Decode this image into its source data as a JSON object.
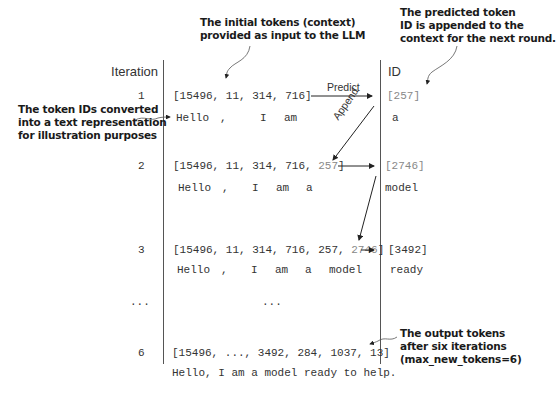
{
  "headers": {
    "iteration": "Iteration",
    "id": "ID"
  },
  "annotations": {
    "initial_tokens": [
      "The initial tokens (context)",
      "provided as input to the LLM"
    ],
    "predicted_token": [
      "The predicted token",
      "ID is appended to the",
      "context for the next round."
    ],
    "token_ids_text": [
      "The token IDs converted",
      "into a text representation",
      "for illustration purposes"
    ],
    "output_tokens": [
      "The output tokens",
      "after six iterations",
      "(max_new_tokens=6)"
    ]
  },
  "arrow_labels": {
    "predict": "Predict",
    "append": "Append"
  },
  "rows": [
    {
      "iteration": "1",
      "ids_prefix": "[15496, 11, 314, 716]",
      "ids_appended": "",
      "tokens": [
        "Hello",
        ",",
        "I",
        "am"
      ],
      "pred_id": "[257]",
      "pred_text": "a"
    },
    {
      "iteration": "2",
      "ids_prefix": "[15496, 11, 314, 716, ",
      "ids_appended": "257",
      "ids_suffix": "]",
      "tokens": [
        "Hello",
        ",",
        "I",
        "am",
        "a"
      ],
      "pred_id": "[2746]",
      "pred_text": "model"
    },
    {
      "iteration": "3",
      "ids_prefix": "[15496, 11, 314, 716, 257, ",
      "ids_appended": "2746",
      "ids_suffix": "]",
      "tokens": [
        "Hello",
        ",",
        "I",
        "am",
        "a",
        "model"
      ],
      "pred_id": "[3492]",
      "pred_text": "ready"
    }
  ],
  "ellipsis": {
    "iteration": "...",
    "ids": "..."
  },
  "final_row": {
    "iteration": "6",
    "ids": "[15496, ..., 3492, 284, 1037, 13]",
    "text": "Hello, I am a model ready to help."
  }
}
